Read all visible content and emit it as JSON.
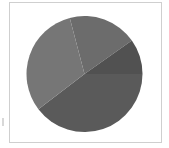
{
  "chart_data": {
    "type": "pie",
    "title": "",
    "legend": [],
    "start_angle_deg": -14.7,
    "direction": "clockwise",
    "slices": [
      {
        "label": "",
        "value": 19.3,
        "color": "#6c6c6c"
      },
      {
        "label": "",
        "value": 9.8,
        "color": "#515151"
      },
      {
        "label": "",
        "value": 39.6,
        "color": "#5a5a5a"
      },
      {
        "label": "",
        "value": 31.3,
        "color": "#767676"
      }
    ]
  }
}
